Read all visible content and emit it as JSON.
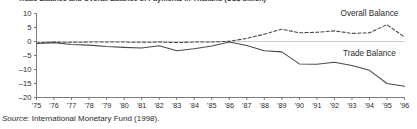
{
  "figure": {
    "title_clipped": "Trade Balance and Overall Balance of Payments in Thailand (US$ billion)",
    "source_prefix": "Source:",
    "source_text": "International Monetary Fund (1998)."
  },
  "chart_data": {
    "type": "line",
    "title": "Trade Balance and Overall Balance of Payments in Thailand (US$ billion)",
    "xlabel": "",
    "ylabel": "",
    "ylim": [
      -20,
      10
    ],
    "yticks": [
      10,
      5,
      0,
      -5,
      -10,
      -15,
      -20
    ],
    "ytick_labels": [
      "10",
      "5",
      "0",
      "–5",
      "–10",
      "–15",
      "–20"
    ],
    "grid": false,
    "zero_line": true,
    "legend": "inline-annotations",
    "x": [
      1975,
      1976,
      1977,
      1978,
      1979,
      1980,
      1981,
      1982,
      1983,
      1984,
      1985,
      1986,
      1987,
      1988,
      1989,
      1990,
      1991,
      1992,
      1993,
      1994,
      1995,
      1996
    ],
    "categories": [
      "'75",
      "'76",
      "'77",
      "'78",
      "'79",
      "'80",
      "'81",
      "'82",
      "'83",
      "'84",
      "'85",
      "'86",
      "'87",
      "'88",
      "'89",
      "'90",
      "'91",
      "'92",
      "'93",
      "'94",
      "'95",
      "'96"
    ],
    "series": [
      {
        "name": "Overall Balance",
        "style": "dashed",
        "color": "#4a4a4a",
        "label": "Overall Balance",
        "values": [
          -0.5,
          -0.2,
          -0.3,
          -0.2,
          -0.2,
          -0.2,
          -0.3,
          -0.2,
          -0.4,
          -0.2,
          -0.2,
          0.1,
          1.1,
          2.6,
          4.4,
          3.1,
          3.3,
          3.8,
          2.9,
          3.1,
          6.0,
          1.6
        ]
      },
      {
        "name": "Trade Balance",
        "style": "solid",
        "color": "#4a4a4a",
        "label": "Trade Balance",
        "values": [
          -0.7,
          -0.4,
          -1.1,
          -1.3,
          -1.8,
          -2.1,
          -2.3,
          -1.5,
          -3.3,
          -2.6,
          -1.6,
          -0.2,
          -1.4,
          -3.3,
          -3.7,
          -8.0,
          -8.1,
          -7.4,
          -8.6,
          -10.3,
          -15.0,
          -16.0
        ]
      }
    ],
    "annotations": [
      {
        "text": "Overall Balance",
        "series": "Overall Balance",
        "x": 1994,
        "y": 9.0
      },
      {
        "text": "Trade Balance",
        "series": "Trade Balance",
        "x": 1994,
        "y": -5.3
      }
    ]
  }
}
